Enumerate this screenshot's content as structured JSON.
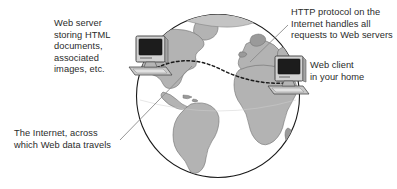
{
  "diagram": {
    "type": "concept-illustration",
    "labels": {
      "web_server": "Web server\nstoring HTML\ndocuments,\nassociated\nimages, etc.",
      "http": "HTTP protocol on the\nInternet handles all\nrequests to Web servers",
      "web_client": "Web client\nin your home",
      "internet": "The Internet, across\nwhich Web data travels"
    },
    "nodes": [
      {
        "name": "web-server-computer",
        "icon": "desktop-computer-icon"
      },
      {
        "name": "web-client-computer",
        "icon": "desktop-computer-icon"
      }
    ],
    "connection": {
      "name": "http-dashed-connection",
      "style": "dashed-arc",
      "from": "web-server-computer",
      "to": "web-client-computer"
    },
    "globe": {
      "name": "earth-globe",
      "landmasses": [
        "North America",
        "South America",
        "Europe",
        "Africa",
        "Greenland"
      ]
    },
    "colors": {
      "ink": "#2b2b2b",
      "outline": "#1a1a1a",
      "ocean": "#ffffff",
      "land": "#b3b3b3",
      "land_dark": "#9a9a9a",
      "screen": "#1c1c1c",
      "case_light": "#d6d6d6",
      "case_mid": "#a8a8a8",
      "case_dark": "#7d7d7d",
      "leader": "#777777"
    }
  }
}
